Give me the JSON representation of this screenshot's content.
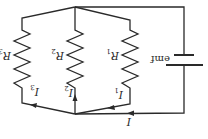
{
  "diagram": {
    "type": "parallel-resistor-circuit",
    "orientation": "rotated-180",
    "colors": {
      "line": "#2a2a2a",
      "background": "#ffffff"
    },
    "source": {
      "label": "emf",
      "symbol": "battery-icon"
    },
    "resistors": [
      {
        "id": "R1",
        "label": "R",
        "sub": "1"
      },
      {
        "id": "R2",
        "label": "R",
        "sub": "2"
      },
      {
        "id": "R3",
        "label": "R",
        "sub": "3"
      }
    ],
    "currents": [
      {
        "id": "I",
        "label": "I",
        "sub": ""
      },
      {
        "id": "I1",
        "label": "I",
        "sub": "1"
      },
      {
        "id": "I2",
        "label": "I",
        "sub": "2"
      },
      {
        "id": "I3",
        "label": "I",
        "sub": "3"
      }
    ]
  }
}
